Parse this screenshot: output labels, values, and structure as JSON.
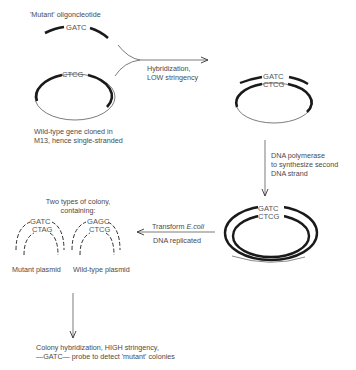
{
  "diagram": {
    "topic": "Oligonucleotide-directed site-specific mutagenesis",
    "step1": {
      "oligo_label": "'Mutant' oligoncleotide",
      "oligo_seq": "GATC",
      "template_seq": "CTCG",
      "template_caption_line1": "Wild-type gene cloned in",
      "template_caption_line2": "M13, hence single-stranded"
    },
    "arrow_hybridization": {
      "line1": "Hybridization,",
      "line2": "LOW stringency"
    },
    "step2": {
      "top_seq": "GATC",
      "bottom_seq": "CTCG"
    },
    "arrow_polymerase": {
      "line1": "DNA polymerase",
      "line2": "to synthesize second",
      "line3": "DNA strand"
    },
    "step3": {
      "top_seq": "GATC",
      "bottom_seq": "CTCG"
    },
    "arrow_transform": {
      "line1_prefix": "Transform ",
      "line1_italic": "E.coli",
      "line2": "DNA replicated"
    },
    "step4": {
      "title_line1": "Two types of colony,",
      "title_line2": "containing:",
      "mutant": {
        "top_seq": "GATC",
        "bottom_seq": "CTAG",
        "label": "Mutant plasmid"
      },
      "wildtype": {
        "top_seq": "GAGC",
        "bottom_seq": "CTCG",
        "label": "Wild-type plasmid"
      }
    },
    "final": {
      "line1": "Colony hybridization, HIGH stringency,",
      "line2": "—GATC— probe to detect 'mutant' colonies"
    },
    "colors": {
      "ink": "#1a1a1a",
      "text": "#4a4a4a",
      "background": "#ffffff"
    }
  }
}
